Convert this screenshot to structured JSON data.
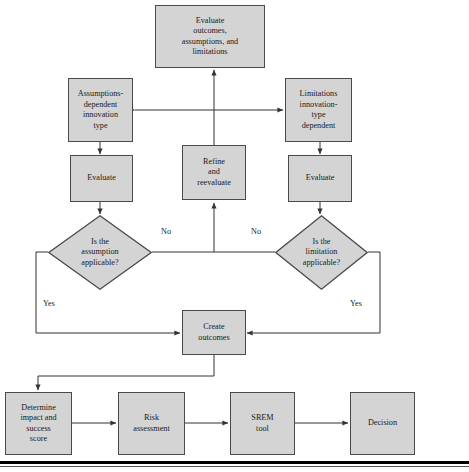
{
  "figure": {
    "type": "flowchart",
    "title": "",
    "canvas": {
      "width": 469,
      "height": 472
    },
    "style": {
      "node_fill": "#d4d4d4",
      "node_border": "#4a4a4a",
      "edge_color": "#333333",
      "text_color": "#1a1a1a",
      "background": "#ffffff"
    }
  },
  "nodes": {
    "evaluate_outcomes": {
      "label": "Evaluate\noutcomes,\nassumptions, and\nlimitations",
      "shape": "rectangle"
    },
    "assumptions_type": {
      "label": "Assumptions-\ndependent\ninnovation\ntype",
      "shape": "rectangle"
    },
    "limitations_type": {
      "label": "Limitations\ninnovation-\ntype\ndependent",
      "shape": "rectangle"
    },
    "evaluate_left": {
      "label": "Evaluate",
      "shape": "rectangle"
    },
    "refine": {
      "label": "Refine\nand\nreevaluate",
      "shape": "rectangle"
    },
    "evaluate_right": {
      "label": "Evaluate",
      "shape": "rectangle"
    },
    "assumption_decision": {
      "label": "Is the\nassumption\napplicable?",
      "shape": "diamond"
    },
    "limitation_decision": {
      "label": "Is the\nlimitation\napplicable?",
      "shape": "diamond"
    },
    "create_outcomes": {
      "label": "Create\noutcomes",
      "shape": "rectangle"
    },
    "determine_score": {
      "label": "Determine\nimpact and\nsuccess\nscore",
      "shape": "rectangle"
    },
    "risk_assessment": {
      "label": "Risk\nassessment",
      "shape": "rectangle"
    },
    "srem_tool": {
      "label": "SREM\ntool",
      "shape": "rectangle"
    },
    "decision": {
      "label": "Decision",
      "shape": "rectangle"
    }
  },
  "edge_labels": {
    "no_left": "No",
    "no_right": "No",
    "yes_left": "Yes",
    "yes_right": "Yes"
  },
  "edges": [
    {
      "from": "assumptions_type",
      "to": "limitations_type",
      "label": "",
      "style": "double-arrow-horizontal"
    },
    {
      "from": "refine",
      "to": "evaluate_outcomes",
      "label": "",
      "style": "arrow-up"
    },
    {
      "from": "assumptions_type",
      "to": "evaluate_left",
      "label": "",
      "style": "arrow-down"
    },
    {
      "from": "limitations_type",
      "to": "evaluate_right",
      "label": "",
      "style": "arrow-down"
    },
    {
      "from": "evaluate_left",
      "to": "assumption_decision",
      "label": "",
      "style": "arrow-down"
    },
    {
      "from": "evaluate_right",
      "to": "limitation_decision",
      "label": "",
      "style": "arrow-down"
    },
    {
      "from": "assumption_decision",
      "to": "refine",
      "label": "No",
      "style": "elbow-up"
    },
    {
      "from": "limitation_decision",
      "to": "refine",
      "label": "No",
      "style": "elbow-up"
    },
    {
      "from": "assumption_decision",
      "to": "create_outcomes",
      "label": "Yes",
      "style": "elbow-down-right"
    },
    {
      "from": "limitation_decision",
      "to": "create_outcomes",
      "label": "Yes",
      "style": "elbow-down-left"
    },
    {
      "from": "create_outcomes",
      "to": "determine_score",
      "label": "",
      "style": "elbow-down-left"
    },
    {
      "from": "determine_score",
      "to": "risk_assessment",
      "label": "",
      "style": "arrow-right"
    },
    {
      "from": "risk_assessment",
      "to": "srem_tool",
      "label": "",
      "style": "arrow-right"
    },
    {
      "from": "srem_tool",
      "to": "decision",
      "label": "",
      "style": "arrow-right"
    }
  ]
}
